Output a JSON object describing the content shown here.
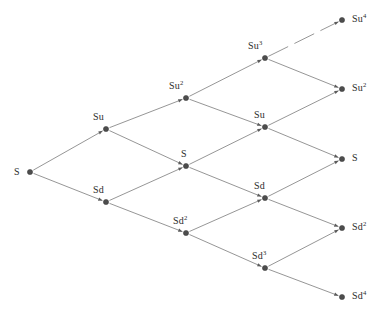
{
  "figure": {
    "name": "binomial-lattice",
    "width": 392,
    "height": 317,
    "background": "#ffffff",
    "line_color": "#8a8a8a",
    "node_color": "#4d4d4d",
    "text_color": "#2b2b2b"
  },
  "nodes": [
    {
      "id": "n0",
      "label": "S",
      "sup": "",
      "x": 30,
      "y": 172,
      "label_x": 14,
      "label_y": 167,
      "label_pos": "left",
      "step": 0
    },
    {
      "id": "n1u",
      "label": "Su",
      "sup": "",
      "x": 106,
      "y": 129,
      "label_x": 93,
      "label_y": 112,
      "label_pos": "above",
      "step": 1
    },
    {
      "id": "n1d",
      "label": "Sd",
      "sup": "",
      "x": 106,
      "y": 202,
      "label_x": 93,
      "label_y": 185,
      "label_pos": "above",
      "step": 1
    },
    {
      "id": "n2u",
      "label": "Su",
      "sup": "2",
      "x": 186,
      "y": 98,
      "label_x": 169,
      "label_y": 81,
      "label_pos": "above",
      "step": 2
    },
    {
      "id": "n2m",
      "label": "S",
      "sup": "",
      "x": 186,
      "y": 166,
      "label_x": 181,
      "label_y": 149,
      "label_pos": "above",
      "step": 2
    },
    {
      "id": "n2d",
      "label": "Sd",
      "sup": "2",
      "x": 186,
      "y": 233,
      "label_x": 173,
      "label_y": 216,
      "label_pos": "above",
      "step": 2
    },
    {
      "id": "n3uu",
      "label": "Su",
      "sup": "3",
      "x": 265,
      "y": 58,
      "label_x": 248,
      "label_y": 41,
      "label_pos": "above",
      "step": 3
    },
    {
      "id": "n3u",
      "label": "Su",
      "sup": "",
      "x": 265,
      "y": 127,
      "label_x": 254,
      "label_y": 110,
      "label_pos": "above",
      "step": 3
    },
    {
      "id": "n3d",
      "label": "Sd",
      "sup": "",
      "x": 265,
      "y": 198,
      "label_x": 254,
      "label_y": 181,
      "label_pos": "above",
      "step": 3
    },
    {
      "id": "n3dd",
      "label": "Sd",
      "sup": "3",
      "x": 265,
      "y": 268,
      "label_x": 252,
      "label_y": 251,
      "label_pos": "above",
      "step": 3
    },
    {
      "id": "n4a",
      "label": "Su",
      "sup": "4",
      "x": 342,
      "y": 20,
      "label_x": 352,
      "label_y": 14,
      "label_pos": "right",
      "step": 4
    },
    {
      "id": "n4b",
      "label": "Su",
      "sup": "2",
      "x": 342,
      "y": 89,
      "label_x": 352,
      "label_y": 83,
      "label_pos": "right",
      "step": 4
    },
    {
      "id": "n4c",
      "label": "S",
      "sup": "",
      "x": 342,
      "y": 159,
      "label_x": 352,
      "label_y": 153,
      "label_pos": "right",
      "step": 4
    },
    {
      "id": "n4d",
      "label": "Sd",
      "sup": "2",
      "x": 342,
      "y": 228,
      "label_x": 352,
      "label_y": 222,
      "label_pos": "right",
      "step": 4
    },
    {
      "id": "n4e",
      "label": "Sd",
      "sup": "4",
      "x": 342,
      "y": 297,
      "label_x": 352,
      "label_y": 291,
      "label_pos": "right",
      "step": 4
    }
  ],
  "edges": [
    {
      "from": "n0",
      "to": "n1u",
      "kind": "up",
      "dashed": false
    },
    {
      "from": "n0",
      "to": "n1d",
      "kind": "down",
      "dashed": false
    },
    {
      "from": "n1u",
      "to": "n2u",
      "kind": "up",
      "dashed": false
    },
    {
      "from": "n1u",
      "to": "n2m",
      "kind": "down",
      "dashed": false
    },
    {
      "from": "n1d",
      "to": "n2m",
      "kind": "up",
      "dashed": false
    },
    {
      "from": "n1d",
      "to": "n2d",
      "kind": "down",
      "dashed": false
    },
    {
      "from": "n2u",
      "to": "n3uu",
      "kind": "up",
      "dashed": false
    },
    {
      "from": "n2u",
      "to": "n3u",
      "kind": "down",
      "dashed": false
    },
    {
      "from": "n2m",
      "to": "n3u",
      "kind": "up",
      "dashed": false
    },
    {
      "from": "n2m",
      "to": "n3d",
      "kind": "down",
      "dashed": false
    },
    {
      "from": "n2d",
      "to": "n3d",
      "kind": "up",
      "dashed": false
    },
    {
      "from": "n2d",
      "to": "n3dd",
      "kind": "down",
      "dashed": false
    },
    {
      "from": "n3uu",
      "to": "n4a",
      "kind": "up",
      "dashed": true
    },
    {
      "from": "n3uu",
      "to": "n4b",
      "kind": "down",
      "dashed": false
    },
    {
      "from": "n3u",
      "to": "n4b",
      "kind": "up",
      "dashed": false
    },
    {
      "from": "n3u",
      "to": "n4c",
      "kind": "down",
      "dashed": false
    },
    {
      "from": "n3d",
      "to": "n4c",
      "kind": "up",
      "dashed": false
    },
    {
      "from": "n3d",
      "to": "n4d",
      "kind": "down",
      "dashed": false
    },
    {
      "from": "n3dd",
      "to": "n4d",
      "kind": "up",
      "dashed": false
    },
    {
      "from": "n3dd",
      "to": "n4e",
      "kind": "down",
      "dashed": false
    }
  ],
  "chart_data": {
    "type": "diagram",
    "subtype": "recombining-binomial-lattice",
    "title": "",
    "steps": 4,
    "levels": [
      {
        "step": 0,
        "labels": [
          "S"
        ]
      },
      {
        "step": 1,
        "labels": [
          "Su",
          "Sd"
        ]
      },
      {
        "step": 2,
        "labels": [
          "Su2",
          "S",
          "Sd2"
        ]
      },
      {
        "step": 3,
        "labels": [
          "Su3",
          "Su",
          "Sd",
          "Sd3"
        ]
      },
      {
        "step": 4,
        "labels": [
          "Su4",
          "Su2",
          "S",
          "Sd2",
          "Sd4"
        ]
      }
    ]
  }
}
